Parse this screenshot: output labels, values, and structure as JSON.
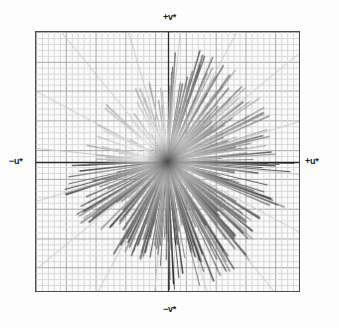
{
  "figure": {
    "title": "",
    "background_color": "#ffffff",
    "width": 339,
    "height": 328
  },
  "axes": {
    "top_label": "+v*",
    "bottom_label": "−v*",
    "left_label": "−u*",
    "right_label": "+u*",
    "frame_color": "#4a4a4a",
    "axis_line_color": "#2b2b2b",
    "minor_grid_color": "#d8d8d8",
    "major_grid_color": "#a8a8a8",
    "radial_guide_color": "#c9c9c9",
    "plot_background": "#fbfbfb"
  },
  "chart_data": {
    "type": "scatter",
    "title": "",
    "xlabel": "u*",
    "ylabel": "v*",
    "xlim": [
      -1,
      1
    ],
    "ylim": [
      -1,
      1
    ],
    "grid": true,
    "legend": null,
    "minor_grid_divisions": 44,
    "major_grid_every": 5,
    "radial_guide_count": 16,
    "series": [
      {
        "name": "chromaticity-shift-vectors",
        "point_count": 300,
        "angle_unit": "degrees",
        "note": "Values are (angle_deg, radius) pairs in normalized plot units; radius 1.0 equals half the plot width."
      }
    ],
    "quadrant_density": {
      "upper_right": 0.26,
      "lower_right": 0.31,
      "lower_left": 0.27,
      "upper_left": 0.16
    },
    "tone_range": {
      "near_origin": "#cfcfcf",
      "far_tip": "#151515"
    }
  }
}
